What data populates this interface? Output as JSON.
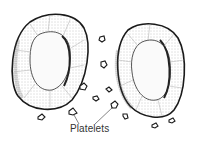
{
  "diagram": {
    "labels": [
      {
        "text": "Platelets",
        "x": 70,
        "y": 122
      }
    ],
    "elements": {
      "cells": [
        {
          "name": "red-blood-cell-left",
          "cx": 50,
          "cy": 60
        },
        {
          "name": "red-blood-cell-right",
          "cx": 150,
          "cy": 70
        }
      ],
      "platelet_count": 13
    },
    "colors": {
      "outline": "#1a1a1a",
      "stipple": "#888888",
      "background": "#ffffff"
    }
  }
}
